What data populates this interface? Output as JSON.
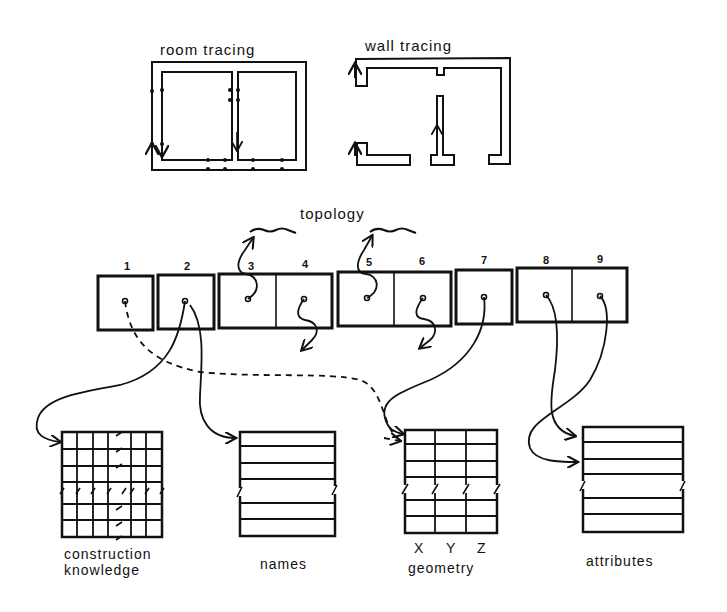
{
  "titles": {
    "room_tracing": "room tracing",
    "wall_tracing": "wall tracing",
    "topology": "topology"
  },
  "record": {
    "cells": [
      {
        "id": "1",
        "label": "1"
      },
      {
        "id": "2",
        "label": "2"
      },
      {
        "id": "3",
        "label": "3"
      },
      {
        "id": "4",
        "label": "4"
      },
      {
        "id": "5",
        "label": "5"
      },
      {
        "id": "6",
        "label": "6"
      },
      {
        "id": "7",
        "label": "7"
      },
      {
        "id": "8",
        "label": "8"
      },
      {
        "id": "9",
        "label": "9"
      }
    ],
    "groups": [
      [
        "1"
      ],
      [
        "2"
      ],
      [
        "3",
        "4"
      ],
      [
        "5",
        "6"
      ],
      [
        "7"
      ],
      [
        "8",
        "9"
      ]
    ]
  },
  "tables": {
    "construction_knowledge": {
      "label_line1": "construction",
      "label_line2": "knowledge"
    },
    "names": {
      "label": "names"
    },
    "geometry": {
      "label": "geometry",
      "columns": [
        "X",
        "Y",
        "Z"
      ]
    },
    "attributes": {
      "label": "attributes"
    }
  },
  "links": [
    {
      "from": "1",
      "to": "geometry",
      "style": "dashed"
    },
    {
      "from": "2",
      "to": "construction_knowledge",
      "style": "solid"
    },
    {
      "from": "2",
      "to": "names",
      "style": "solid"
    },
    {
      "from": "3",
      "to": "topology",
      "style": "solid"
    },
    {
      "from": "4",
      "to": "outside",
      "style": "solid"
    },
    {
      "from": "5",
      "to": "topology",
      "style": "solid"
    },
    {
      "from": "6",
      "to": "outside",
      "style": "solid"
    },
    {
      "from": "7",
      "to": "geometry",
      "style": "solid"
    },
    {
      "from": "8",
      "to": "attributes",
      "style": "solid"
    },
    {
      "from": "9",
      "to": "attributes",
      "style": "solid"
    }
  ],
  "colors": {
    "ink": "#111111",
    "paper": "#ffffff"
  }
}
